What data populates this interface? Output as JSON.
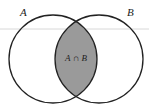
{
  "diagram": {
    "type": "venn",
    "sets": [
      {
        "label": "A"
      },
      {
        "label": "B"
      }
    ],
    "intersection_label": "A ∩ B",
    "colors": {
      "intersection_fill": "#9a9a9a",
      "stroke": "#222222"
    }
  }
}
